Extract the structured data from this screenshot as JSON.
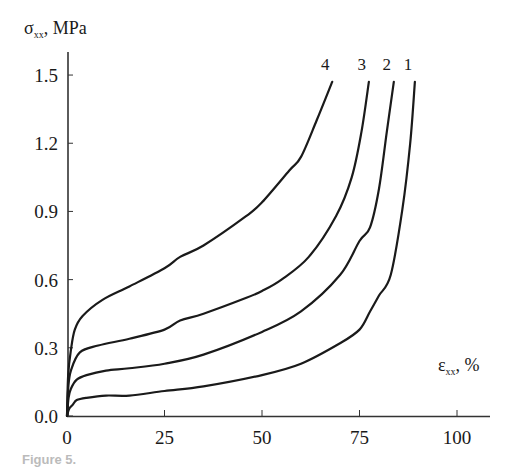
{
  "chart_data": {
    "type": "line",
    "title": "",
    "xlabel": "ε_xx, %",
    "ylabel": "σ_xx, MPa",
    "xlabel_main": "ε",
    "xlabel_sub": "xx",
    "xlabel_unit": ",  %",
    "ylabel_main": "σ",
    "ylabel_sub": "xx",
    "ylabel_unit": ",  MPa",
    "xlim": [
      0,
      108
    ],
    "ylim": [
      0,
      1.6
    ],
    "x_ticks": [
      0,
      25,
      50,
      75,
      100
    ],
    "x_tick_labels": [
      "0",
      "25",
      "50",
      "75",
      "100"
    ],
    "y_ticks": [
      0.0,
      0.3,
      0.6,
      0.9,
      1.2,
      1.5
    ],
    "y_tick_labels": [
      "0.0",
      "0.3",
      "0.6",
      "0.9",
      "1.2",
      "1.5"
    ],
    "grid": false,
    "legend": "inline labels at curve ends",
    "series": [
      {
        "name": "1",
        "x": [
          0,
          0.5,
          1.5,
          2.5,
          5,
          10,
          16,
          25,
          35,
          50,
          60,
          70,
          75,
          77.7,
          80,
          83,
          86,
          88,
          89.2
        ],
        "y": [
          0,
          0.03,
          0.05,
          0.07,
          0.08,
          0.09,
          0.09,
          0.11,
          0.13,
          0.18,
          0.23,
          0.32,
          0.38,
          0.46,
          0.53,
          0.62,
          0.91,
          1.2,
          1.47
        ]
      },
      {
        "name": "2",
        "x": [
          0,
          0.4,
          1,
          2.5,
          5,
          10,
          16,
          25,
          35,
          50,
          60,
          70,
          75,
          77.7,
          80,
          82,
          83.8
        ],
        "y": [
          0,
          0.08,
          0.12,
          0.16,
          0.18,
          0.2,
          0.21,
          0.23,
          0.27,
          0.37,
          0.46,
          0.62,
          0.77,
          0.83,
          1.0,
          1.25,
          1.47
        ]
      },
      {
        "name": "3",
        "x": [
          0,
          0.3,
          1,
          3.3,
          8,
          16,
          25,
          29,
          35,
          46,
          50,
          55,
          62,
          69,
          73,
          75.5,
          77.4
        ],
        "y": [
          0,
          0.12,
          0.2,
          0.28,
          0.31,
          0.34,
          0.38,
          0.42,
          0.45,
          0.52,
          0.55,
          0.6,
          0.7,
          0.88,
          1.05,
          1.25,
          1.47
        ]
      },
      {
        "name": "4",
        "x": [
          0,
          0.3,
          1,
          2,
          4,
          9,
          16,
          25,
          29,
          35,
          46,
          50,
          57,
          60,
          64,
          68
        ],
        "y": [
          0,
          0.18,
          0.29,
          0.38,
          0.44,
          0.51,
          0.57,
          0.65,
          0.7,
          0.75,
          0.88,
          0.94,
          1.08,
          1.14,
          1.3,
          1.47
        ]
      }
    ],
    "annotations": [
      "4",
      "3",
      "2",
      "1"
    ]
  },
  "caption": "Figure 5."
}
